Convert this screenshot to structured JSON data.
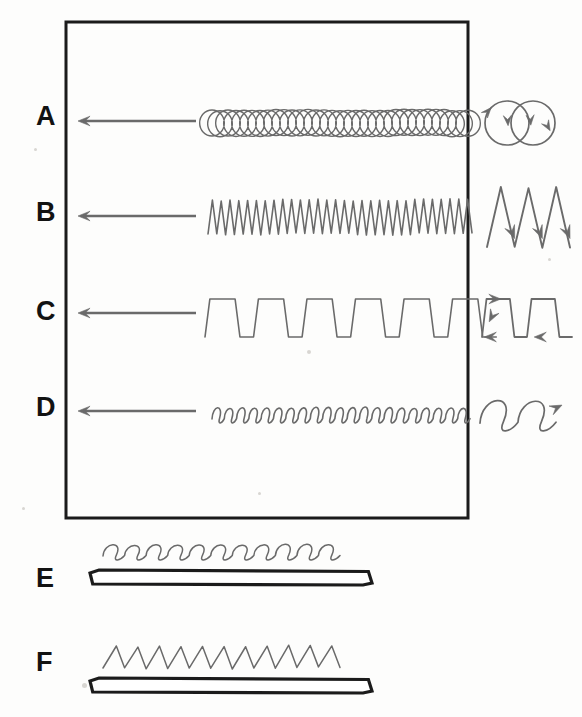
{
  "figure": {
    "background_color": "#fdfdfc",
    "ink_color": "#6a6a6a",
    "frame_color": "#1b1b1b",
    "label_color": "#121212"
  },
  "panel": {
    "name": "bordered-panel",
    "x": 66,
    "y": 22,
    "width": 402,
    "height": 496,
    "border_width": 3
  },
  "rows": [
    {
      "label": "A",
      "label_x": 36,
      "label_y": 103,
      "arrow": {
        "from_x": 196,
        "to_x": 78,
        "y": 121,
        "direction": "left"
      },
      "trace": {
        "kind": "overlapping-circles",
        "x_start": 208,
        "x_end": 472,
        "y_center": 123,
        "amplitude": 13,
        "cycles": 33,
        "description": "dense chain of overlapping circular loops"
      },
      "inset": {
        "kind": "two-overlapping-circles",
        "cx": 520,
        "cy": 123,
        "radius": 22,
        "separation": 26,
        "arrowheads": 4,
        "description": "two overlapping circles with direction arrowheads"
      }
    },
    {
      "label": "B",
      "label_x": 36,
      "label_y": 199,
      "arrow": {
        "from_x": 196,
        "to_x": 78,
        "y": 216,
        "direction": "left"
      },
      "trace": {
        "kind": "zigzag",
        "x_start": 208,
        "x_end": 472,
        "y_center": 217,
        "amplitude": 17,
        "cycles": 30,
        "description": "tight sawtooth zigzag oscillation"
      },
      "inset": {
        "kind": "zigzag-W",
        "x_start": 487,
        "x_end": 570,
        "y_center": 217,
        "amplitude": 30,
        "cycles": 3,
        "arrowheads": 3,
        "description": "enlarged W zigzag with arrowheads on down strokes"
      }
    },
    {
      "label": "C",
      "label_x": 36,
      "label_y": 298,
      "arrow": {
        "from_x": 196,
        "to_x": 78,
        "y": 313,
        "direction": "left"
      },
      "trace": {
        "kind": "trapezoid-zigzag",
        "x_start": 205,
        "x_end": 472,
        "y_center": 318,
        "amplitude": 19,
        "cycles": 5.5,
        "description": "repeated Z / trapezoid units on a baseline"
      },
      "inset": {
        "kind": "trapezoid-zigzag",
        "x_start": 482,
        "x_end": 572,
        "y_center": 318,
        "amplitude": 19,
        "cycles": 2,
        "arrowheads": 4,
        "description": "enlarged double Z with travel-direction arrowheads"
      }
    },
    {
      "label": "D",
      "label_x": 36,
      "label_y": 394,
      "arrow": {
        "from_x": 196,
        "to_x": 78,
        "y": 411,
        "direction": "left"
      },
      "trace": {
        "kind": "cursive-loops",
        "x_start": 212,
        "x_end": 470,
        "y_center": 415,
        "amplitude": 9,
        "cycles": 21,
        "description": "chain of small cursive e-loops"
      },
      "inset": {
        "kind": "cursive-loops",
        "x_start": 480,
        "x_end": 556,
        "y_center": 415,
        "amplitude": 18,
        "cycles": 2,
        "arrowheads": 1,
        "description": "enlarged two cursive loops ending in an arrowhead"
      }
    }
  ],
  "bottom_rows": [
    {
      "label": "E",
      "label_x": 36,
      "label_y": 565,
      "trace": {
        "kind": "cursive-loops",
        "x_start": 103,
        "x_end": 340,
        "y_center": 552,
        "amplitude": 9,
        "cycles": 11,
        "description": "loose cursive loop trace"
      },
      "bar": {
        "kind": "perspective-strip",
        "x_left": 90,
        "x_right": 372,
        "y_top": 570,
        "height": 15,
        "bevel": 9,
        "description": "long flat strip drawn in perspective with chamfered ends"
      }
    },
    {
      "label": "F",
      "label_x": 36,
      "label_y": 649,
      "trace": {
        "kind": "zigzag",
        "x_start": 103,
        "x_end": 340,
        "y_center": 657,
        "amplitude": 11,
        "cycles": 11,
        "description": "sawtooth zigzag trace"
      },
      "bar": {
        "kind": "perspective-strip",
        "x_left": 90,
        "x_right": 372,
        "y_top": 678,
        "height": 15,
        "bevel": 9,
        "description": "long flat strip drawn in perspective with chamfered ends"
      }
    }
  ],
  "specks": [
    {
      "x": 34,
      "y": 148,
      "d": 3
    },
    {
      "x": 22,
      "y": 507,
      "d": 3
    },
    {
      "x": 307,
      "y": 350,
      "d": 4
    },
    {
      "x": 258,
      "y": 492,
      "d": 3
    },
    {
      "x": 82,
      "y": 683,
      "d": 5
    },
    {
      "x": 548,
      "y": 258,
      "d": 3
    }
  ]
}
